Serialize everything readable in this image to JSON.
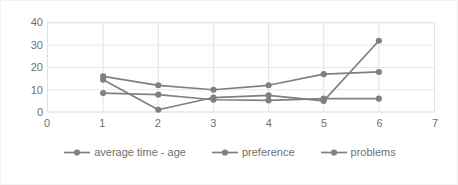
{
  "chart_data": {
    "type": "line",
    "title": "",
    "xlabel": "",
    "ylabel": "",
    "xlim": [
      0,
      7
    ],
    "ylim": [
      0,
      40
    ],
    "grid": true,
    "legend_position": "bottom",
    "x": [
      1,
      2,
      3,
      4,
      5,
      6
    ],
    "x_ticks": [
      "0",
      "1",
      "2",
      "3",
      "4",
      "5",
      "6",
      "7"
    ],
    "y_ticks": [
      "0",
      "10",
      "20",
      "30",
      "40"
    ],
    "series": [
      {
        "name": "average time - age",
        "color": "#808080",
        "values": [
          14.5,
          1,
          6.5,
          7.5,
          5,
          32
        ]
      },
      {
        "name": "preference",
        "color": "#808080",
        "values": [
          16,
          12,
          10,
          12,
          17,
          18
        ]
      },
      {
        "name": "problems",
        "color": "#808080",
        "values": [
          8.5,
          7.8,
          5.5,
          5.2,
          6,
          6
        ]
      }
    ]
  },
  "legend": {
    "items": [
      {
        "label": "average time - age"
      },
      {
        "label": "preference"
      },
      {
        "label": "problems"
      }
    ]
  },
  "colors": {
    "series": "#808080",
    "grid": "#e8e8e8",
    "axis_text": "#707070",
    "frame": "#f2f2f2",
    "background": "#ffffff"
  }
}
